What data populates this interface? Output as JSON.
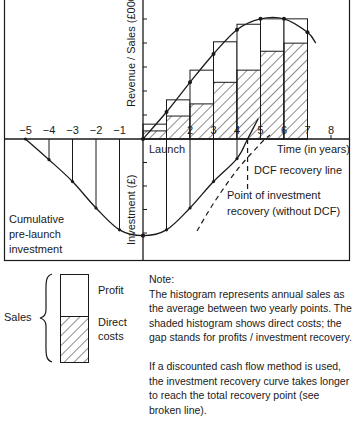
{
  "diagram": {
    "y_axis_upper_label": "Revenue / Sales (£000s)",
    "y_axis_lower_label": "Investment (£)",
    "x_axis_label": "Time (in years)",
    "launch_label": "Launch",
    "pre_launch_label_lines": [
      "Cumulative",
      "pre-launch",
      "investment"
    ],
    "dcf_label": "DCF recovery line",
    "recovery_point_label_lines": [
      "Point of investment",
      "recovery (without DCF)"
    ],
    "x_ticks": [
      {
        "value": -5,
        "label": "−5"
      },
      {
        "value": -4,
        "label": "−4"
      },
      {
        "value": -3,
        "label": "−3"
      },
      {
        "value": -2,
        "label": "−2"
      },
      {
        "value": -1,
        "label": "−1"
      },
      {
        "value": 2,
        "label": "2"
      },
      {
        "value": 3,
        "label": "3"
      },
      {
        "value": 4,
        "label": "4"
      },
      {
        "value": 5,
        "label": "5"
      },
      {
        "value": 6,
        "label": "6"
      },
      {
        "value": 7,
        "label": "7"
      },
      {
        "value": 8,
        "label": "8"
      }
    ],
    "sales_curve": [
      [
        0,
        0
      ],
      [
        1,
        1.0
      ],
      [
        2,
        2.1
      ],
      [
        3,
        3.15
      ],
      [
        4,
        4.05
      ],
      [
        5,
        4.45
      ],
      [
        6,
        4.45
      ],
      [
        7,
        3.95
      ],
      [
        7.35,
        3.55
      ]
    ],
    "histogram": [
      {
        "year_start": 0,
        "year_end": 1,
        "sales": 0.55,
        "direct_costs": 0.3
      },
      {
        "year_start": 1,
        "year_end": 2,
        "sales": 1.45,
        "direct_costs": 0.85
      },
      {
        "year_start": 2,
        "year_end": 3,
        "sales": 2.55,
        "direct_costs": 1.3
      },
      {
        "year_start": 3,
        "year_end": 4,
        "sales": 3.6,
        "direct_costs": 2.1
      },
      {
        "year_start": 4,
        "year_end": 5,
        "sales": 4.25,
        "direct_costs": 2.55
      },
      {
        "year_start": 5,
        "year_end": 6,
        "sales": 4.45,
        "direct_costs": 3.25
      },
      {
        "year_start": 6,
        "year_end": 7,
        "sales": 4.45,
        "direct_costs": 3.55
      }
    ],
    "investment_curve": [
      [
        -5,
        0
      ],
      [
        -4,
        -0.9
      ],
      [
        -3,
        -1.85
      ],
      [
        -2,
        -3.0
      ],
      [
        -1,
        -3.95
      ],
      [
        0,
        -4.2
      ],
      [
        1,
        -3.95
      ],
      [
        2,
        -3.0
      ],
      [
        3,
        -1.85
      ],
      [
        4,
        -0.85
      ],
      [
        4.45,
        0
      ],
      [
        4.9,
        0.75
      ]
    ],
    "dcf_curve": [
      [
        2.3,
        -4.0
      ],
      [
        3.0,
        -2.8
      ],
      [
        4.0,
        -1.35
      ],
      [
        5.0,
        -0.2
      ],
      [
        5.4,
        0.15
      ]
    ],
    "recovery_point_year": 4.45
  },
  "legend": {
    "group_label": "Sales",
    "items": [
      {
        "label_lines": [
          "Profit"
        ],
        "fill": "plain"
      },
      {
        "label_lines": [
          "Direct",
          "costs"
        ],
        "fill": "hatched"
      }
    ]
  },
  "note": {
    "title": "Note:",
    "paragraphs": [
      "The histogram represents annual sales as the average between two yearly points. The shaded histogram shows direct costs; the gap stands for profits / investment recovery.",
      "If a discounted cash flow method is used, the investment recovery curve takes longer to reach the total recovery point (see broken line)."
    ]
  }
}
